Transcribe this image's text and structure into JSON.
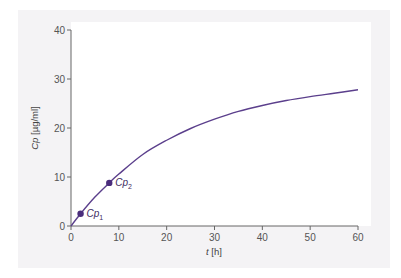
{
  "chart_data": {
    "type": "line",
    "title": "",
    "xlabel": "t [h]",
    "ylabel": "Cp [µg/ml]",
    "xlim": [
      0,
      60
    ],
    "ylim": [
      0,
      40
    ],
    "xticks": [
      0,
      10,
      20,
      30,
      40,
      50,
      60
    ],
    "yticks": [
      0,
      10,
      20,
      30,
      40
    ],
    "xtick_labels": [
      "0",
      "10",
      "20",
      "30",
      "40",
      "50",
      "60"
    ],
    "ytick_labels": [
      "0",
      "10",
      "20",
      "30",
      "40"
    ],
    "grid": false,
    "legend": null,
    "series": [
      {
        "name": "Cp(t)",
        "color": "#5b3f8c",
        "x": [
          0,
          2,
          5,
          8,
          10,
          15,
          20,
          25,
          30,
          35,
          40,
          45,
          50,
          55,
          60
        ],
        "y": [
          0,
          2.5,
          5.9,
          8.8,
          10.6,
          14.6,
          17.5,
          19.9,
          21.8,
          23.4,
          24.6,
          25.6,
          26.4,
          27.1,
          27.8
        ]
      }
    ],
    "annotations": [
      {
        "label": "Cp1",
        "display": "Cp",
        "subscript": "1",
        "x": 2,
        "y": 2.5,
        "marker_color": "#4a2d7c"
      },
      {
        "label": "Cp2",
        "display": "Cp",
        "subscript": "2",
        "x": 8,
        "y": 8.8,
        "marker_color": "#4a2d7c"
      }
    ]
  },
  "colors": {
    "panel_bg": "#f4f3f5",
    "plot_bg": "#ffffff",
    "axis": "#666666",
    "curve": "#5b3f8c"
  }
}
